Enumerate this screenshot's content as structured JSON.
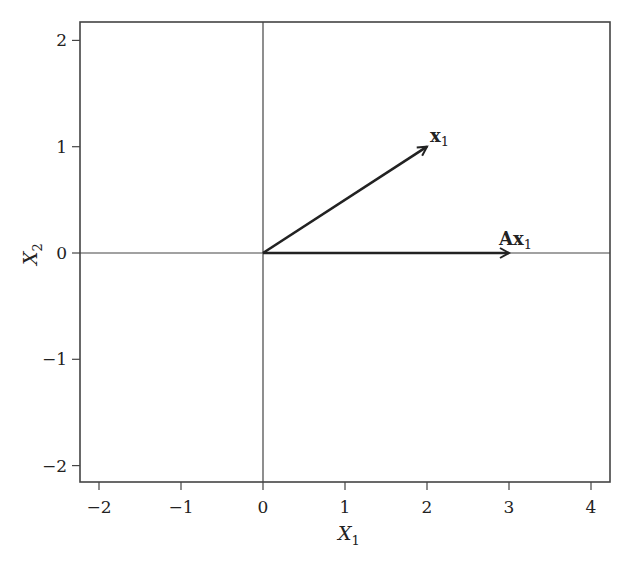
{
  "chart_data": {
    "type": "vector-plot",
    "title": "",
    "xlabel": "X1",
    "ylabel": "X2",
    "xlim": [
      -2.2,
      4.2
    ],
    "ylim": [
      -2.15,
      2.15
    ],
    "xticks": [
      -2,
      -1,
      0,
      1,
      2,
      3,
      4
    ],
    "yticks": [
      -2,
      -1,
      0,
      1,
      2
    ],
    "xtick_labels": [
      "−2",
      "−1",
      "0",
      "1",
      "2",
      "3",
      "4"
    ],
    "ytick_labels": [
      "−2",
      "−1",
      "0",
      "1",
      "2"
    ],
    "reference_lines": {
      "vertical_x": 0,
      "horizontal_y": 0
    },
    "grid": false,
    "vectors": [
      {
        "name": "x1",
        "label": "x",
        "subscript": "1",
        "from": [
          0,
          0
        ],
        "to": [
          2,
          1
        ]
      },
      {
        "name": "Ax1",
        "label": "Ax",
        "subscript": "1",
        "from": [
          0,
          0
        ],
        "to": [
          3,
          0
        ]
      }
    ],
    "axis_labels": {
      "x": {
        "main": "X",
        "sub": "1"
      },
      "y": {
        "main": "X",
        "sub": "2"
      }
    }
  },
  "colors": {
    "line": "#222222",
    "frame": "#444444",
    "background": "#ffffff"
  }
}
